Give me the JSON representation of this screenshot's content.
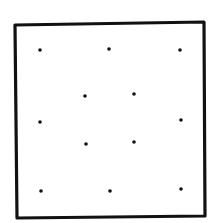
{
  "diagram": {
    "type": "dot-grid-in-square",
    "square": {
      "points": [
        [
          15,
          25
        ],
        [
          204,
          22
        ],
        [
          205,
          216
        ],
        [
          17,
          218
        ]
      ],
      "stroke": "#111111",
      "stroke_width": 3.2
    },
    "dots": [
      {
        "x": 40,
        "y": 50
      },
      {
        "x": 109,
        "y": 49
      },
      {
        "x": 180,
        "y": 50
      },
      {
        "x": 85,
        "y": 96
      },
      {
        "x": 134,
        "y": 94
      },
      {
        "x": 40,
        "y": 122
      },
      {
        "x": 181,
        "y": 120
      },
      {
        "x": 86,
        "y": 144
      },
      {
        "x": 134,
        "y": 142
      },
      {
        "x": 41,
        "y": 191
      },
      {
        "x": 110,
        "y": 191
      },
      {
        "x": 181,
        "y": 189
      }
    ],
    "dot_radius": 1.8,
    "dot_color": "#111111",
    "background": "#ffffff"
  }
}
